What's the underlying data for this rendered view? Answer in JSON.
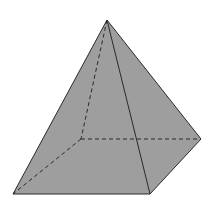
{
  "diagram": {
    "type": "square-pyramid",
    "fill_color": "#9e9e9e",
    "edge_color": "#2a2a2a",
    "background": "#ffffff",
    "vertices": {
      "apex": [
        107,
        20
      ],
      "base_front_left": [
        13,
        194
      ],
      "base_front_right": [
        150,
        194
      ],
      "base_back_right": [
        201,
        139
      ],
      "base_back_left": [
        81,
        139
      ]
    },
    "visible_edges": [
      [
        "apex",
        "base_front_left"
      ],
      [
        "apex",
        "base_front_right"
      ],
      [
        "apex",
        "base_back_right"
      ],
      [
        "base_front_left",
        "base_front_right"
      ],
      [
        "base_front_right",
        "base_back_right"
      ]
    ],
    "hidden_edges": [
      [
        "apex",
        "base_back_left"
      ],
      [
        "base_back_left",
        "base_front_left"
      ],
      [
        "base_back_left",
        "base_back_right"
      ]
    ]
  }
}
